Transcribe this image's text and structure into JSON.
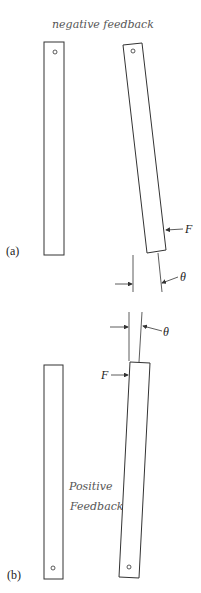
{
  "diagram": {
    "annotations": {
      "top_note": "negative feedback",
      "bottom_note_line1": "Positive",
      "bottom_note_line2": "Feedback"
    },
    "panel_a": {
      "label": "(a)",
      "force_label": "F",
      "angle_label": "θ"
    },
    "panel_b": {
      "label": "(b)",
      "force_label": "F",
      "angle_label": "θ"
    }
  }
}
